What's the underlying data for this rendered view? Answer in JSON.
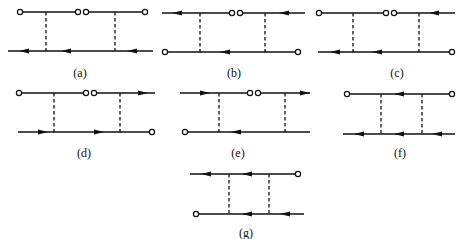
{
  "figure": {
    "panels": [
      {
        "id": "a",
        "label": "(a)",
        "x": [
          8,
          153
        ],
        "top": 12,
        "bottom": 51,
        "rungs": [
          46,
          115
        ],
        "top_segments": [
          {
            "x1": 20,
            "x2": 78,
            "end_circles": [
              20,
              78
            ]
          },
          {
            "x1": 86,
            "x2": 145,
            "end_circles": [
              86,
              145
            ]
          }
        ],
        "bottom_segments": [
          {
            "x1": 8,
            "x2": 153,
            "end_circles": []
          }
        ],
        "arrows": [
          {
            "y": "bottom",
            "x": 25,
            "dir": "left"
          },
          {
            "y": "bottom",
            "x": 67,
            "dir": "left"
          },
          {
            "y": "bottom",
            "x": 133,
            "dir": "left"
          }
        ]
      },
      {
        "id": "b",
        "label": "(b)",
        "x": [
          162,
          305
        ],
        "top": 13,
        "bottom": 52,
        "rungs": [
          200,
          265
        ],
        "top_segments": [
          {
            "x1": 162,
            "x2": 232,
            "end_circles": [
              232
            ]
          },
          {
            "x1": 240,
            "x2": 305,
            "end_circles": [
              240
            ]
          }
        ],
        "bottom_segments": [
          {
            "x1": 165,
            "x2": 298,
            "end_circles": [
              165,
              298
            ]
          }
        ],
        "arrows": [
          {
            "y": "top",
            "x": 178,
            "dir": "left"
          },
          {
            "y": "top",
            "x": 285,
            "dir": "left"
          },
          {
            "y": "bottom",
            "x": 226,
            "dir": "left"
          }
        ]
      },
      {
        "id": "c",
        "label": "(c)",
        "x": [
          318,
          455
        ],
        "top": 13,
        "bottom": 52,
        "rungs": [
          353,
          419
        ],
        "top_segments": [
          {
            "x1": 319,
            "x2": 386,
            "end_circles": [
              319,
              386
            ]
          },
          {
            "x1": 394,
            "x2": 455,
            "end_circles": [
              394
            ]
          }
        ],
        "bottom_segments": [
          {
            "x1": 318,
            "x2": 452,
            "end_circles": [
              452
            ]
          }
        ],
        "arrows": [
          {
            "y": "top",
            "x": 435,
            "dir": "left"
          },
          {
            "y": "bottom",
            "x": 336,
            "dir": "left"
          },
          {
            "y": "bottom",
            "x": 378,
            "dir": "left"
          }
        ]
      },
      {
        "id": "d",
        "label": "(d)",
        "x": [
          18,
          155
        ],
        "top": 93,
        "bottom": 132,
        "rungs": [
          54,
          120
        ],
        "top_segments": [
          {
            "x1": 19,
            "x2": 86,
            "end_circles": [
              19,
              86
            ]
          },
          {
            "x1": 94,
            "x2": 155,
            "end_circles": [
              94
            ]
          }
        ],
        "bottom_segments": [
          {
            "x1": 18,
            "x2": 152,
            "end_circles": [
              152
            ]
          }
        ],
        "arrows": [
          {
            "y": "top",
            "x": 142,
            "dir": "right"
          },
          {
            "y": "bottom",
            "x": 42,
            "dir": "right"
          },
          {
            "y": "bottom",
            "x": 98,
            "dir": "right"
          }
        ]
      },
      {
        "id": "e",
        "label": "(e)",
        "x": [
          180,
          310
        ],
        "top": 93,
        "bottom": 132,
        "rungs": [
          219,
          285
        ],
        "top_segments": [
          {
            "x1": 180,
            "x2": 250,
            "end_circles": [
              250
            ]
          },
          {
            "x1": 258,
            "x2": 310,
            "end_circles": [
              258
            ]
          }
        ],
        "bottom_segments": [
          {
            "x1": 185,
            "x2": 310,
            "end_circles": [
              185
            ]
          }
        ],
        "arrows": [
          {
            "y": "top",
            "x": 204,
            "dir": "right"
          },
          {
            "y": "top",
            "x": 304,
            "dir": "right"
          },
          {
            "y": "bottom",
            "x": 237,
            "dir": "left"
          }
        ]
      },
      {
        "id": "f",
        "label": "(f)",
        "x": [
          343,
          455
        ],
        "top": 94,
        "bottom": 134,
        "rungs": [
          381,
          422
        ],
        "top_segments": [
          {
            "x1": 347,
            "x2": 452,
            "end_circles": [
              347,
              452
            ]
          }
        ],
        "bottom_segments": [
          {
            "x1": 343,
            "x2": 455,
            "end_circles": []
          }
        ],
        "arrows": [
          {
            "y": "top",
            "x": 400,
            "dir": "left"
          },
          {
            "y": "bottom",
            "x": 360,
            "dir": "left"
          },
          {
            "y": "bottom",
            "x": 400,
            "dir": "left"
          },
          {
            "y": "bottom",
            "x": 438,
            "dir": "left"
          }
        ]
      },
      {
        "id": "g",
        "label": "(g)",
        "x": [
          190,
          304
        ],
        "top": 174,
        "bottom": 214,
        "rungs": [
          229,
          269
        ],
        "top_segments": [
          {
            "x1": 190,
            "x2": 298,
            "end_circles": [
              298
            ]
          }
        ],
        "bottom_segments": [
          {
            "x1": 196,
            "x2": 304,
            "end_circles": [
              196
            ]
          }
        ],
        "arrows": [
          {
            "y": "top",
            "x": 207,
            "dir": "left"
          },
          {
            "y": "top",
            "x": 248,
            "dir": "left"
          },
          {
            "y": "bottom",
            "x": 248,
            "dir": "left"
          },
          {
            "y": "bottom",
            "x": 286,
            "dir": "left"
          }
        ]
      }
    ]
  }
}
